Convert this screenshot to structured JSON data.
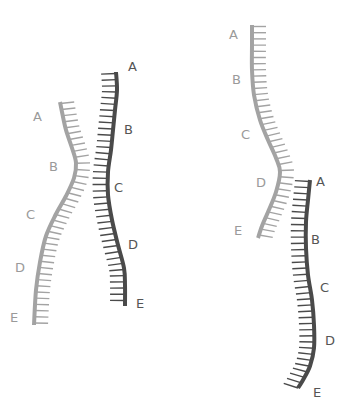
{
  "colors": {
    "light_strand": "#a3a3a3",
    "dark_strand": "#4a4a4a",
    "light_label": "#9a9a9a",
    "dark_label": "#555555",
    "background": "#ffffff"
  },
  "diagrams": [
    {
      "name": "left-pair-crossing",
      "light_strand": {
        "labels": [
          "A",
          "B",
          "C",
          "D",
          "E"
        ],
        "label_positions": [
          [
            33,
            110
          ],
          [
            49,
            160
          ],
          [
            26,
            208
          ],
          [
            15,
            261
          ],
          [
            10,
            311
          ]
        ],
        "path": [
          [
            60,
            102
          ],
          [
            62,
            112
          ],
          [
            66,
            130
          ],
          [
            72,
            148
          ],
          [
            76,
            163
          ],
          [
            74,
            178
          ],
          [
            66,
            196
          ],
          [
            56,
            214
          ],
          [
            46,
            236
          ],
          [
            40,
            262
          ],
          [
            36,
            290
          ],
          [
            34,
            325
          ]
        ]
      },
      "dark_strand": {
        "labels": [
          "A",
          "B",
          "C",
          "D",
          "E"
        ],
        "label_positions": [
          [
            128,
            60
          ],
          [
            124,
            123
          ],
          [
            114,
            181
          ],
          [
            128,
            238
          ],
          [
            136,
            297
          ]
        ],
        "path": [
          [
            116,
            72
          ],
          [
            117,
            90
          ],
          [
            115,
            110
          ],
          [
            113,
            130
          ],
          [
            111,
            150
          ],
          [
            108,
            172
          ],
          [
            108,
            195
          ],
          [
            112,
            220
          ],
          [
            118,
            245
          ],
          [
            124,
            268
          ],
          [
            125,
            285
          ],
          [
            125,
            306
          ]
        ]
      }
    },
    {
      "name": "right-pair-offset",
      "light_strand": {
        "labels": [
          "A",
          "B",
          "C",
          "D",
          "E"
        ],
        "label_positions": [
          [
            229,
            28
          ],
          [
            232,
            73
          ],
          [
            241,
            128
          ],
          [
            256,
            176
          ],
          [
            234,
            224
          ]
        ],
        "path": [
          [
            252,
            25
          ],
          [
            252,
            45
          ],
          [
            252,
            70
          ],
          [
            254,
            95
          ],
          [
            260,
            120
          ],
          [
            268,
            140
          ],
          [
            276,
            158
          ],
          [
            280,
            172
          ],
          [
            276,
            192
          ],
          [
            268,
            212
          ],
          [
            262,
            226
          ],
          [
            258,
            238
          ]
        ]
      },
      "dark_strand": {
        "labels": [
          "A",
          "B",
          "C",
          "D",
          "E"
        ],
        "label_positions": [
          [
            316,
            175
          ],
          [
            311,
            233
          ],
          [
            320,
            281
          ],
          [
            325,
            334
          ],
          [
            313,
            386
          ]
        ],
        "path": [
          [
            310,
            180
          ],
          [
            308,
            200
          ],
          [
            306,
            222
          ],
          [
            306,
            248
          ],
          [
            308,
            275
          ],
          [
            312,
            300
          ],
          [
            314,
            325
          ],
          [
            314,
            348
          ],
          [
            310,
            366
          ],
          [
            303,
            380
          ],
          [
            298,
            388
          ]
        ]
      }
    }
  ]
}
